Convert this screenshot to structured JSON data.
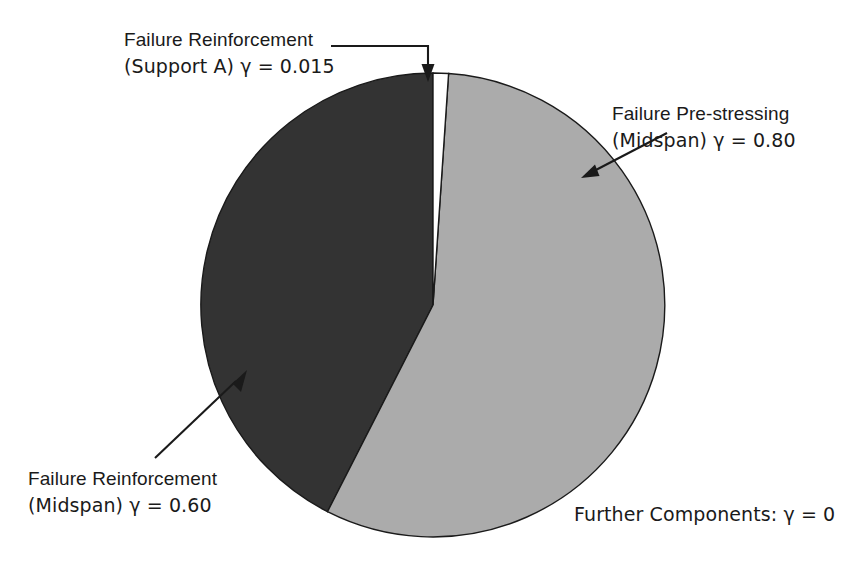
{
  "figure": {
    "background_color": "#ffffff",
    "width": 868,
    "height": 567
  },
  "chart_data": {
    "type": "pie",
    "title": "",
    "subtitle": "",
    "xlabel": "",
    "ylabel": "",
    "legend_position": "none",
    "grid": false,
    "start_angle_deg": 0,
    "direction": "clockwise",
    "center": {
      "x": 433,
      "y": 305
    },
    "radius": 232,
    "value_label": "γ",
    "categories": [
      "Failure Reinforcement (Support A)",
      "Failure Pre-stressing (Midspan)",
      "Failure Reinforcement (Midspan)",
      "Further Components"
    ],
    "values": [
      0.015,
      0.8,
      0.6,
      0
    ],
    "value_strings": [
      "0.015",
      "0.80",
      "0.60",
      "0"
    ],
    "colors": [
      "#ffffff",
      "#ababab",
      "#333333",
      "#ffffff"
    ],
    "slices": [
      {
        "name": "Failure Reinforcement (Support A)",
        "value": 0.015,
        "value_string": "0.015",
        "color": "#ffffff",
        "edge_color": "#1a1a1a",
        "start_deg": 0,
        "end_deg": 3.85
      },
      {
        "name": "Failure Pre-stressing (Midspan)",
        "value": 0.8,
        "value_string": "0.80",
        "color": "#ababab",
        "edge_color": "#1a1a1a",
        "start_deg": 3.85,
        "end_deg": 207.2
      },
      {
        "name": "Failure Reinforcement (Midspan)",
        "value": 0.6,
        "value_string": "0.60",
        "color": "#333333",
        "edge_color": "#1a1a1a",
        "start_deg": 207.2,
        "end_deg": 360
      },
      {
        "name": "Further Components",
        "value": 0,
        "value_string": "0",
        "color": "#ffffff",
        "edge_color": "#1a1a1a",
        "start_deg": 360,
        "end_deg": 360
      }
    ]
  },
  "annotations": {
    "support_a": {
      "line1": "Failure Reinforcement",
      "line2": "(Support A) γ = 0.015"
    },
    "prestressing": {
      "line1": "Failure Pre-stressing",
      "line2": "(Midspan) γ = 0.80"
    },
    "reinforcement_midspan": {
      "line1": "Failure Reinforcement",
      "line2": "(Midspan) γ = 0.60"
    },
    "further_components": {
      "line1": "Further Components: γ = 0"
    }
  },
  "style": {
    "text_color": "#1a1a1a",
    "leader_line_color": "#1a1a1a",
    "slice_dark": "#333333",
    "slice_light": "#ababab",
    "slice_white": "#ffffff"
  }
}
